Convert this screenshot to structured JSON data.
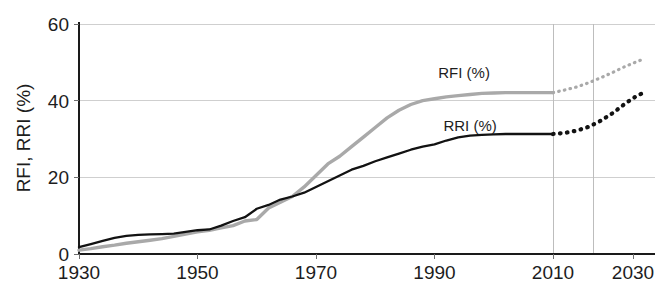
{
  "chart_data": {
    "type": "line",
    "title": "",
    "xlabel": "",
    "ylabel": "RFI, RRI (%)",
    "xlim": [
      1930,
      2033
    ],
    "ylim": [
      0,
      60
    ],
    "grid": true,
    "legend_position": "inline-annotations",
    "x_ticks": [
      1930,
      1950,
      1970,
      1990,
      2010,
      2030
    ],
    "x_tick_labels": [
      "1930",
      "1950",
      "1970",
      "1990",
      "2010",
      "2030"
    ],
    "y_ticks": [
      0,
      20,
      40,
      60
    ],
    "y_tick_labels": [
      "0",
      "20",
      "40",
      "60"
    ],
    "vertical_gridlines": [
      2010,
      2020
    ],
    "annotations": [
      {
        "text": "RFI (%)",
        "x": 1995,
        "y": 46
      },
      {
        "text": "RRI (%)",
        "x": 1996,
        "y": 32
      }
    ],
    "series": [
      {
        "name": "RFI (%)",
        "color": "#a9a9a9",
        "style": "solid",
        "x": [
          1930,
          1932,
          1934,
          1936,
          1938,
          1940,
          1942,
          1944,
          1946,
          1948,
          1950,
          1952,
          1954,
          1956,
          1958,
          1960,
          1962,
          1964,
          1966,
          1968,
          1970,
          1972,
          1974,
          1976,
          1978,
          1980,
          1982,
          1984,
          1986,
          1988,
          1990,
          1992,
          1994,
          1996,
          1998,
          2000,
          2002,
          2004,
          2006,
          2008,
          2010
        ],
        "values": [
          1.0,
          1.4,
          1.9,
          2.3,
          2.8,
          3.2,
          3.6,
          4.0,
          4.6,
          5.2,
          5.8,
          6.2,
          6.8,
          7.4,
          8.6,
          9.0,
          12.0,
          13.5,
          15.0,
          17.5,
          20.5,
          23.5,
          25.5,
          28.0,
          30.5,
          33.0,
          35.5,
          37.5,
          39.0,
          40.0,
          40.5,
          41.0,
          41.3,
          41.6,
          41.9,
          42.0,
          42.1,
          42.1,
          42.1,
          42.1,
          42.1
        ]
      },
      {
        "name": "RFI (%) projection",
        "color": "#a9a9a9",
        "style": "dotted",
        "x": [
          2010,
          2013,
          2016,
          2019,
          2022,
          2025,
          2028,
          2031,
          2033
        ],
        "values": [
          42.1,
          42.8,
          43.6,
          44.7,
          46.0,
          47.4,
          48.9,
          50.2,
          51.0
        ]
      },
      {
        "name": "RRI (%)",
        "color": "#121212",
        "style": "solid",
        "x": [
          1930,
          1932,
          1934,
          1936,
          1938,
          1940,
          1942,
          1944,
          1946,
          1948,
          1950,
          1952,
          1954,
          1956,
          1958,
          1960,
          1962,
          1964,
          1966,
          1968,
          1970,
          1972,
          1974,
          1976,
          1978,
          1980,
          1982,
          1984,
          1986,
          1988,
          1990,
          1992,
          1994,
          1996,
          1998,
          2000,
          2002,
          2004,
          2006,
          2008,
          2010
        ],
        "values": [
          1.8,
          2.6,
          3.4,
          4.2,
          4.7,
          5.0,
          5.1,
          5.2,
          5.3,
          5.8,
          6.2,
          6.4,
          7.4,
          8.6,
          9.6,
          11.8,
          12.8,
          14.2,
          15.0,
          16.0,
          17.5,
          19.0,
          20.5,
          22.0,
          23.0,
          24.2,
          25.2,
          26.2,
          27.2,
          28.0,
          28.6,
          29.6,
          30.4,
          30.9,
          31.1,
          31.2,
          31.3,
          31.3,
          31.3,
          31.3,
          31.3
        ]
      },
      {
        "name": "RRI (%) projection",
        "color": "#121212",
        "style": "dotted",
        "x": [
          2010,
          2013,
          2016,
          2019,
          2022,
          2025,
          2028,
          2031,
          2033
        ],
        "values": [
          31.3,
          31.6,
          32.2,
          33.2,
          34.8,
          36.8,
          39.2,
          41.3,
          42.2
        ]
      }
    ]
  }
}
